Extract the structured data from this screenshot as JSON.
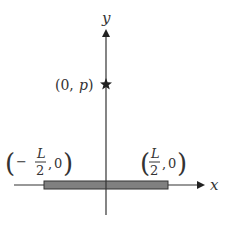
{
  "diagram": {
    "axes": {
      "x_label": "x",
      "y_label": "y"
    },
    "point": {
      "label_open": "(0,",
      "label_var": "p",
      "label_close": ")",
      "marker": "star-icon"
    },
    "rod": {
      "left_end": {
        "paren_open": "(",
        "sign": "−",
        "numerator": "L",
        "denominator": "2",
        "sep": ",",
        "y": "0",
        "paren_close": ")"
      },
      "right_end": {
        "paren_open": "(",
        "numerator": "L",
        "denominator": "2",
        "sep": ",",
        "y": "0",
        "paren_close": ")"
      }
    },
    "colors": {
      "axis": "#333333",
      "rod_fill": "#808080",
      "rod_stroke": "#333333"
    }
  }
}
